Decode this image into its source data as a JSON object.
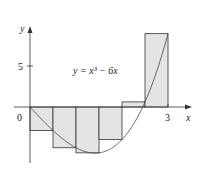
{
  "figure": {
    "equation_label": "y = x³ − 6x",
    "x_axis_label": "x",
    "y_axis_label": "y",
    "origin_label": "0",
    "x_tick_label": "3",
    "y_tick_label": "5"
  },
  "colors": {
    "fill": "#e4e4e4",
    "stroke": "#333333",
    "curve": "#444444"
  },
  "chart_data": {
    "type": "diagram",
    "function": "x^3 - 6x",
    "interval": [
      0,
      3
    ],
    "n": 6,
    "rectangles": [
      {
        "x0": 0.0,
        "x1": 0.5,
        "height": -2.875
      },
      {
        "x0": 0.5,
        "x1": 1.0,
        "height": -5
      },
      {
        "x0": 1.0,
        "x1": 1.5,
        "height": -5.625
      },
      {
        "x0": 1.5,
        "x1": 2.0,
        "height": -4
      },
      {
        "x0": 2.0,
        "x1": 2.5,
        "height": 0.625
      },
      {
        "x0": 2.5,
        "x1": 3.0,
        "height": 9
      }
    ],
    "xticks": [
      0,
      3
    ],
    "yticks": [
      5
    ],
    "xlabel": "x",
    "ylabel": "y"
  }
}
